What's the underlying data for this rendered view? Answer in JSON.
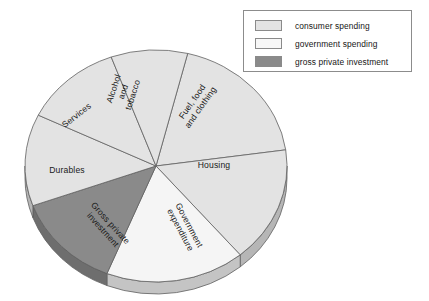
{
  "chart_data": {
    "type": "pie",
    "title": "",
    "three_d": true,
    "legend_position": "top-right",
    "categories": [
      "Fuel, food and clothing",
      "Housing",
      "Government expenditure",
      "Gross private investment",
      "Durables",
      "Services",
      "Alcohol and tobacco"
    ],
    "values": [
      19,
      16,
      17,
      13,
      14,
      13,
      8
    ],
    "slices": [
      {
        "label": "Fuel, food and clothing",
        "label_lines": [
          "Fuel, food",
          "and clothing"
        ],
        "value": 19,
        "group": "consumer spending",
        "color": "#e3e3e3",
        "start_angle": -76,
        "end_angle": -8,
        "label_rotation": -55,
        "label_x": 197,
        "label_y": 105
      },
      {
        "label": "Housing",
        "label_lines": [
          "Housing"
        ],
        "value": 16,
        "group": "consumer spending",
        "color": "#e3e3e3",
        "start_angle": -8,
        "end_angle": 50,
        "label_rotation": 0,
        "label_x": 214,
        "label_y": 166
      },
      {
        "label": "Government expenditure",
        "label_lines": [
          "Government",
          "expenditure"
        ],
        "value": 17,
        "group": "government spending",
        "color": "#f5f5f5",
        "start_angle": 50,
        "end_angle": 112,
        "label_rotation": 62,
        "label_x": 184,
        "label_y": 228
      },
      {
        "label": "Gross private investment",
        "label_lines": [
          "Gross private",
          "investment"
        ],
        "value": 13,
        "group": "gross private investment",
        "color": "#8a8a8a",
        "start_angle": 112,
        "end_angle": 160,
        "label_rotation": 48,
        "label_x": 106,
        "label_y": 227
      },
      {
        "label": "Durables",
        "label_lines": [
          "Durables"
        ],
        "value": 14,
        "group": "consumer spending",
        "color": "#e3e3e3",
        "start_angle": 160,
        "end_angle": 206,
        "label_rotation": 0,
        "label_x": 67,
        "label_y": 171
      },
      {
        "label": "Services",
        "label_lines": [
          "Services"
        ],
        "value": 13,
        "group": "consumer spending",
        "color": "#e3e3e3",
        "start_angle": 206,
        "end_angle": 250,
        "label_rotation": -38,
        "label_x": 77,
        "label_y": 116
      },
      {
        "label": "Alcohol and tobacco",
        "label_lines": [
          "Alcohol",
          "and",
          "tobacco"
        ],
        "value": 8,
        "group": "consumer spending",
        "color": "#e3e3e3",
        "start_angle": 250,
        "end_angle": 284,
        "label_rotation": -72,
        "label_x": 124,
        "label_y": 92
      }
    ]
  },
  "legend": {
    "items": [
      {
        "label": "consumer spending",
        "color": "#e3e3e3"
      },
      {
        "label": "government spending",
        "color": "#f7f7f7"
      },
      {
        "label": "gross private investment",
        "color": "#8a8a8a"
      }
    ]
  }
}
